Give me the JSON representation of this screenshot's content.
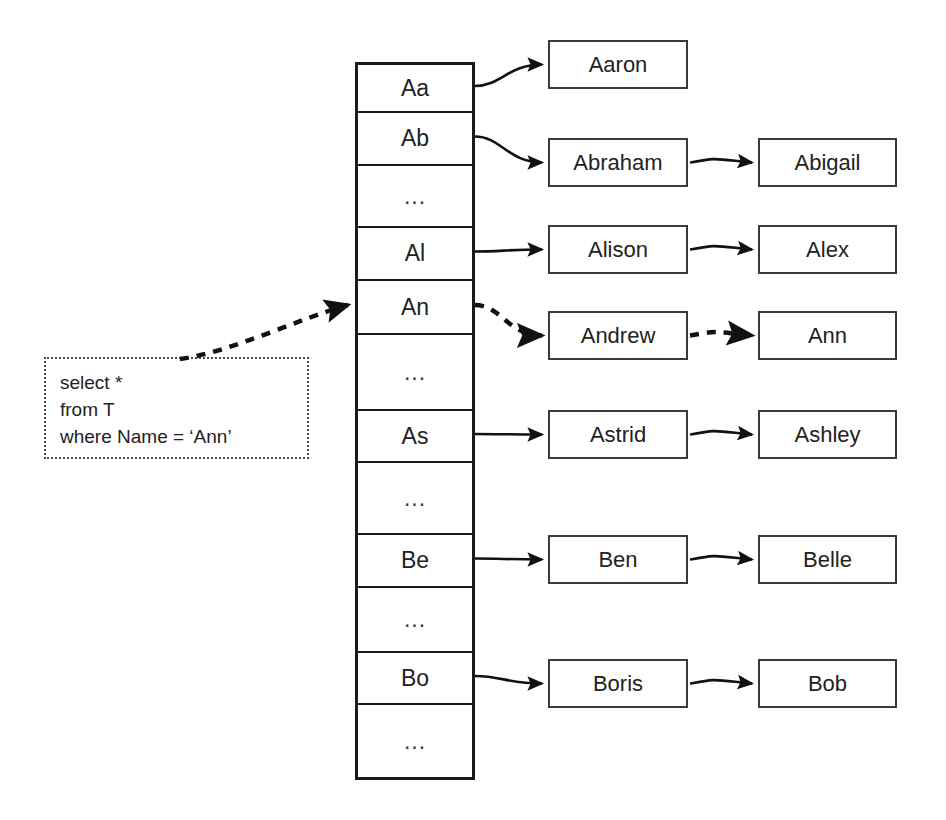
{
  "diagram": {
    "colors": {
      "ink": "#1a1a1a",
      "box_border": "#3a3a3a",
      "query_border": "#4a4a4a",
      "background": "#ffffff"
    }
  },
  "index_column": {
    "name": "hash-bucket-column",
    "rows": [
      {
        "label": "Aa",
        "kind": "key",
        "top": 0,
        "height": 48
      },
      {
        "label": "Ab",
        "kind": "key",
        "top": 48,
        "height": 53
      },
      {
        "label": "...",
        "kind": "ellipsis",
        "top": 101,
        "height": 62
      },
      {
        "label": "Al",
        "kind": "key",
        "top": 163,
        "height": 53
      },
      {
        "label": "An",
        "kind": "key",
        "top": 216,
        "height": 54
      },
      {
        "label": "...",
        "kind": "ellipsis",
        "top": 270,
        "height": 76
      },
      {
        "label": "As",
        "kind": "key",
        "top": 346,
        "height": 52
      },
      {
        "label": "...",
        "kind": "ellipsis",
        "top": 398,
        "height": 72
      },
      {
        "label": "Be",
        "kind": "key",
        "top": 470,
        "height": 53
      },
      {
        "label": "...",
        "kind": "ellipsis",
        "top": 523,
        "height": 65
      },
      {
        "label": "Bo",
        "kind": "key",
        "top": 588,
        "height": 52
      },
      {
        "label": "...",
        "kind": "ellipsis",
        "top": 640,
        "height": 72
      }
    ]
  },
  "chains": [
    {
      "bucket": "Aa",
      "first": "Aaron",
      "second": null,
      "top": 40,
      "highlighted": false
    },
    {
      "bucket": "Ab",
      "first": "Abraham",
      "second": "Abigail",
      "top": 138,
      "highlighted": false
    },
    {
      "bucket": "Al",
      "first": "Alison",
      "second": "Alex",
      "top": 225,
      "highlighted": false
    },
    {
      "bucket": "An",
      "first": "Andrew",
      "second": "Ann",
      "top": 311,
      "highlighted": true
    },
    {
      "bucket": "As",
      "first": "Astrid",
      "second": "Ashley",
      "top": 410,
      "highlighted": false
    },
    {
      "bucket": "Be",
      "first": "Ben",
      "second": "Belle",
      "top": 535,
      "highlighted": false
    },
    {
      "bucket": "Bo",
      "first": "Boris",
      "second": "Bob",
      "top": 659,
      "highlighted": false
    }
  ],
  "query": {
    "name": "sql-query-annotation",
    "lines": [
      "select *",
      "from T",
      "where Name = ‘Ann’"
    ]
  }
}
